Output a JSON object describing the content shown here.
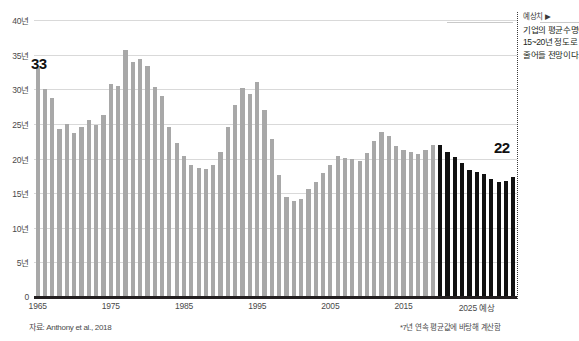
{
  "chart_data": {
    "type": "bar",
    "title": "",
    "subtitle": "",
    "xlabel": "",
    "ylabel": "",
    "ylim": [
      0,
      40
    ],
    "yticks": [
      0,
      5,
      10,
      15,
      20,
      25,
      30,
      35,
      40
    ],
    "ytick_labels": [
      "0",
      "5년",
      "10년",
      "15년",
      "20년",
      "25년",
      "30년",
      "35년",
      "40년"
    ],
    "xtick_labels": [
      "1965",
      "1975",
      "1985",
      "1995",
      "2005",
      "2015",
      "2025 예상"
    ],
    "xtick_years": [
      1965,
      1975,
      1985,
      1995,
      2005,
      2015,
      2025
    ],
    "grid": true,
    "legend_position": "none",
    "x_start_year": 1965,
    "series": [
      {
        "name": "실적치",
        "color": "#a8a8a8",
        "x": [
          1965,
          1966,
          1967,
          1968,
          1969,
          1970,
          1971,
          1972,
          1973,
          1974,
          1975,
          1976,
          1977,
          1978,
          1979,
          1980,
          1981,
          1982,
          1983,
          1984,
          1985,
          1986,
          1987,
          1988,
          1989,
          1990,
          1991,
          1992,
          1993,
          1994,
          1995,
          1996,
          1997,
          1998,
          1999,
          2000,
          2001,
          2002,
          2003,
          2004,
          2005,
          2006,
          2007,
          2008,
          2009,
          2010,
          2011,
          2012,
          2013,
          2014,
          2015,
          2016,
          2017,
          2018,
          2019
        ],
        "values": [
          33.0,
          30.0,
          28.7,
          24.2,
          25.0,
          23.7,
          24.6,
          25.5,
          24.8,
          26.3,
          30.7,
          30.4,
          35.7,
          34.0,
          34.3,
          33.4,
          30.3,
          29.0,
          24.5,
          22.3,
          20.4,
          19.0,
          18.6,
          18.5,
          19.1,
          21.0,
          24.5,
          27.8,
          30.2,
          29.3,
          31.1,
          27.0,
          22.8,
          17.6,
          14.5,
          13.8,
          14.2,
          15.6,
          16.6,
          17.9,
          19.0,
          20.4,
          20.1,
          19.9,
          19.6,
          20.8,
          22.6,
          23.9,
          23.2,
          21.8,
          21.2,
          20.9,
          20.7,
          21.3,
          22.0
        ]
      },
      {
        "name": "예상치",
        "color": "#111111",
        "x": [
          2020,
          2021,
          2022,
          2023,
          2024,
          2025,
          2026,
          2027,
          2028,
          2029,
          2030
        ],
        "values": [
          22.0,
          21.0,
          20.2,
          19.3,
          18.4,
          18.0,
          17.8,
          17.0,
          16.6,
          16.8,
          17.4
        ]
      }
    ],
    "annotations": [
      {
        "name": "start-value",
        "text": "33",
        "x": 1965,
        "y": 33.0
      },
      {
        "name": "forecast-value",
        "text": "22",
        "x": 2020,
        "y": 22.0
      }
    ]
  },
  "callouts": {
    "start_value": "33",
    "forecast_value": "22"
  },
  "yaxis": {
    "labels": [
      "40년",
      "35년",
      "30년",
      "25년",
      "20년",
      "15년",
      "10년",
      "5년",
      "0"
    ],
    "values": [
      40,
      35,
      30,
      25,
      20,
      15,
      10,
      5,
      0
    ]
  },
  "xaxis": {
    "labels": [
      "1965",
      "1975",
      "1985",
      "1995",
      "2005",
      "2015",
      "2025 예상"
    ],
    "years": [
      1965,
      1975,
      1985,
      1995,
      2005,
      2015,
      2025
    ]
  },
  "annotation": {
    "header": "예상치 ▶",
    "line1": "기업의 평균수명이",
    "line2": "15~20년 정도로",
    "line3": "줄어들 전망이다."
  },
  "footnotes": {
    "source": "자료: Anthony et al., 2018",
    "method": "*7년 연속 평균값에 바탕해 계산함"
  },
  "colors": {
    "actual_bar": "#a8a8a8",
    "forecast_bar": "#111111",
    "gridline": "#d9d9d9",
    "axis": "#231f20",
    "text": "#231f20"
  }
}
